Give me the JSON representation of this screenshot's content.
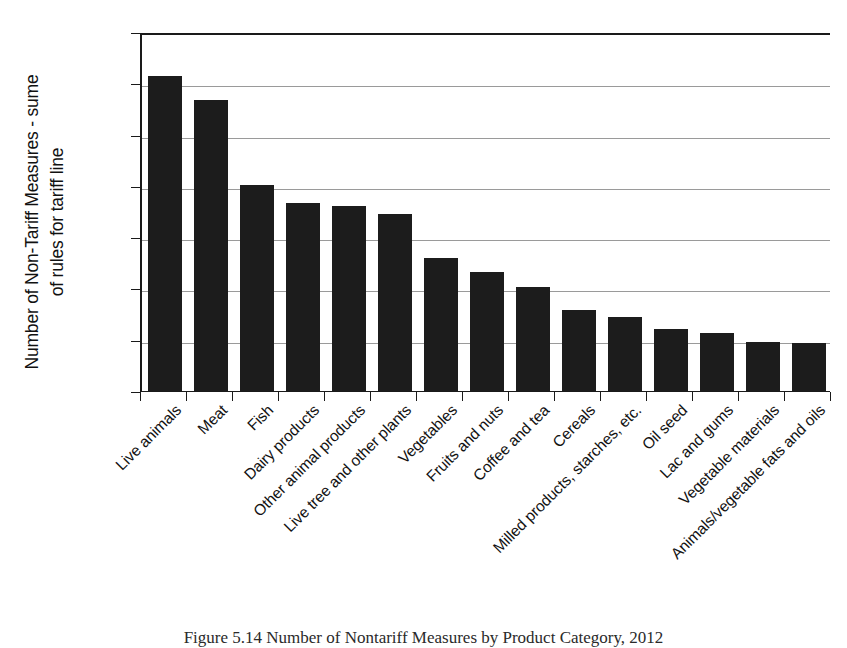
{
  "figure": {
    "caption": "Figure 5.14  Number of Nontariff Measures by Product Category, 2012"
  },
  "chart_data": {
    "type": "bar",
    "title": "",
    "xlabel": "",
    "ylabel": "Number of Non-Tariff Measures - sume\nof rules for tariff line",
    "ylim": [
      0,
      7000
    ],
    "yticks": [
      0,
      1000,
      2000,
      3000,
      4000,
      5000,
      6000,
      7000
    ],
    "ytick_labels": [
      "0",
      "1000",
      "2000",
      "3000",
      "4000",
      "5000",
      "6000",
      "7000"
    ],
    "grid": true,
    "legend": null,
    "bar_color": "#1c1c1c",
    "categories": [
      "Live animals",
      "Meat",
      "Fish",
      "Dairy products",
      "Other animal products",
      "Live tree and other plants",
      "Vegetables",
      "Fruits and nuts",
      "Coffee and tea",
      "Cereals",
      "Milled products, starches, etc.",
      "Oil seed",
      "Lac and gums",
      "Vegetable materials",
      "Animals/vegetable fats and oils"
    ],
    "values": [
      6150,
      5680,
      4020,
      3670,
      3610,
      3450,
      2600,
      2330,
      2030,
      1570,
      1450,
      1200,
      1140,
      950,
      940
    ]
  }
}
